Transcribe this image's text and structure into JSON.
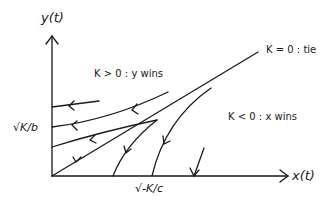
{
  "axes": {
    "y_label": "y(t)",
    "x_label": "x(t)"
  },
  "ticks": {
    "y_tick": "√K/b",
    "x_tick": "√-K/c"
  },
  "regions": {
    "upper": "K > 0 : y wins",
    "diagonal": "K = 0 : tie",
    "lower": "K < 0 : x wins"
  },
  "colors": {
    "ink": "#1a1a1a",
    "background": "#ffffff"
  }
}
